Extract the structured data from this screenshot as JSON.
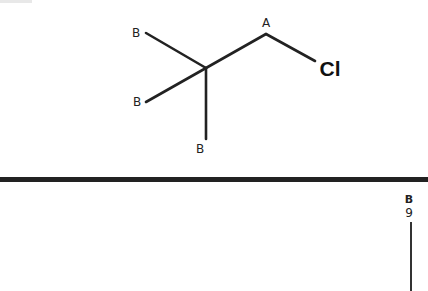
{
  "diagram": {
    "type": "skeletal-structure",
    "molecule": {
      "atoms": [
        {
          "id": "center",
          "label": "",
          "x": 206,
          "y": 68
        },
        {
          "id": "b1",
          "label": "B",
          "x": 136,
          "y": 32
        },
        {
          "id": "b2",
          "label": "B",
          "x": 137,
          "y": 102
        },
        {
          "id": "b3",
          "label": "B",
          "x": 200,
          "y": 148
        },
        {
          "id": "a",
          "label": "A",
          "x": 266,
          "y": 22
        },
        {
          "id": "cl",
          "label": "Cl",
          "x": 330,
          "y": 68
        }
      ],
      "bonds": [
        {
          "from": "b1",
          "to": "center"
        },
        {
          "from": "b2",
          "to": "center"
        },
        {
          "from": "center",
          "to": "b3"
        },
        {
          "from": "center",
          "to": "a"
        },
        {
          "from": "a",
          "to": "cl"
        }
      ]
    },
    "divider": {
      "y": 180,
      "color": "#222222"
    },
    "lower_fragment": {
      "label_top": "B",
      "label_bottom": "9"
    }
  }
}
